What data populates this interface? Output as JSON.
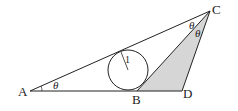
{
  "diagram": {
    "points": {
      "A": {
        "label": "A",
        "x": 30,
        "y": 91
      },
      "B": {
        "label": "B",
        "x": 137,
        "y": 91
      },
      "C": {
        "label": "C",
        "x": 210,
        "y": 11
      },
      "D": {
        "label": "D",
        "x": 182,
        "y": 91
      }
    },
    "circle": {
      "cx": 128,
      "cy": 70,
      "r": 20,
      "radius_label": "1"
    },
    "angles": {
      "at_A": "θ",
      "at_C_upper": "θ",
      "at_C_lower": "θ"
    },
    "shaded_region": "triangle BCD",
    "colors": {
      "line": "#222222",
      "shade": "#d6d6d6",
      "background": "#ffffff"
    }
  }
}
